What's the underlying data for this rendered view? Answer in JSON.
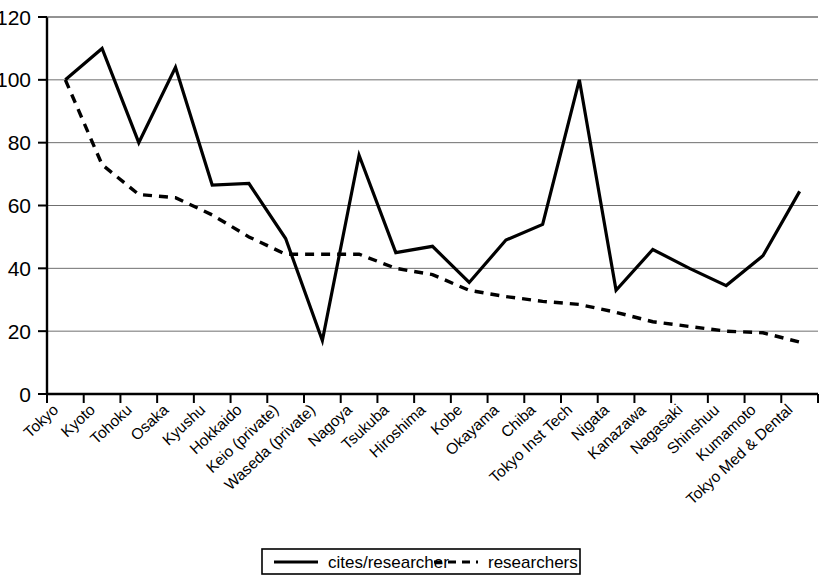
{
  "chart_data": {
    "type": "line",
    "title": "",
    "subtitle": "",
    "xlabel": "",
    "ylabel": "",
    "ylim": [
      0,
      120
    ],
    "ytick_labels": [
      "0",
      "20",
      "40",
      "60",
      "80",
      "100",
      "120"
    ],
    "yticks": [
      0,
      20,
      40,
      60,
      80,
      100,
      120
    ],
    "grid": "horizontal",
    "legend_position": "bottom-center",
    "categories": [
      "Tokyo",
      "Kyoto",
      "Tohoku",
      "Osaka",
      "Kyushu",
      "Hokkaido",
      "Keio (private)",
      "Waseda (private)",
      "Nagoya",
      "Tsukuba",
      "Hiroshima",
      "Kobe",
      "Okayama",
      "Chiba",
      "Tokyo Inst Tech",
      "Nigata",
      "Kanazawa",
      "Nagasaki",
      "Shinshuu",
      "Kumamoto",
      "Tokyo Med & Dental"
    ],
    "series": [
      {
        "name": "cites/researcher",
        "style": "solid",
        "color": "#000000",
        "values": [
          100,
          110,
          80,
          104,
          66.5,
          67,
          49.5,
          17,
          76,
          45,
          47,
          35.5,
          49,
          54,
          100,
          33,
          46,
          40,
          34.5,
          44,
          64.5
        ]
      },
      {
        "name": "researchers",
        "style": "dashed",
        "color": "#000000",
        "values": [
          100,
          73,
          63.5,
          62.5,
          57,
          50,
          44.5,
          44.5,
          44.5,
          40,
          38,
          33,
          31,
          29.5,
          28.5,
          26,
          23,
          21.5,
          20,
          19.5,
          16.5
        ]
      }
    ]
  },
  "legend": {
    "items": [
      {
        "label": "cites/researcher",
        "style": "solid"
      },
      {
        "label": "researchers",
        "style": "dashed"
      }
    ]
  }
}
